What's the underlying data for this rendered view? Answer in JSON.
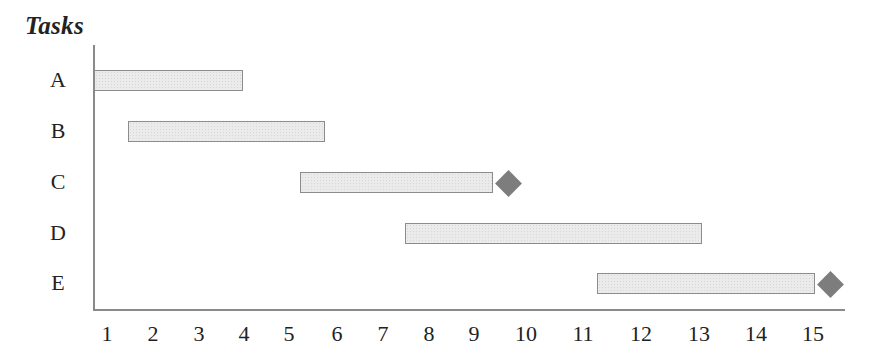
{
  "chart_data": {
    "type": "gantt",
    "title": "Tasks",
    "xlabel": "",
    "ylabel": "Tasks",
    "x_ticks": [
      1,
      2,
      3,
      4,
      5,
      6,
      7,
      8,
      9,
      10,
      11,
      12,
      13,
      14,
      15
    ],
    "x_tick_px": [
      107,
      153,
      199,
      244,
      289,
      337,
      383,
      429,
      474,
      526,
      583,
      641,
      699,
      756,
      813
    ],
    "xlim": [
      0.75,
      15.6
    ],
    "grid": false,
    "categories": [
      "A",
      "B",
      "C",
      "D",
      "E"
    ],
    "series": [
      {
        "task": "A",
        "start": 0.75,
        "end": 4.0,
        "milestone": null
      },
      {
        "task": "B",
        "start": 1.5,
        "end": 5.75,
        "milestone": null
      },
      {
        "task": "C",
        "start": 5.25,
        "end": 9.35,
        "milestone": 9.65
      },
      {
        "task": "D",
        "start": 7.5,
        "end": 13.0,
        "milestone": null
      },
      {
        "task": "E",
        "start": 11.25,
        "end": 15.0,
        "milestone": 15.3
      }
    ],
    "colors": {
      "bar_fill": "#ebebeb",
      "bar_border": "#8c8c8c",
      "milestone": "#7d7d7d",
      "axis": "#8a8a8a"
    }
  },
  "layout": {
    "rows": [
      {
        "label": "A",
        "y": 70,
        "bar_x": 94,
        "bar_w": 149,
        "diamond_x": null
      },
      {
        "label": "B",
        "y": 121,
        "bar_x": 128,
        "bar_w": 197,
        "diamond_x": null
      },
      {
        "label": "C",
        "y": 172,
        "bar_x": 300,
        "bar_w": 193,
        "diamond_x": 508
      },
      {
        "label": "D",
        "y": 223,
        "bar_x": 405,
        "bar_w": 297,
        "diamond_x": null
      },
      {
        "label": "E",
        "y": 273,
        "bar_x": 597,
        "bar_w": 218,
        "diamond_x": 830
      }
    ]
  }
}
